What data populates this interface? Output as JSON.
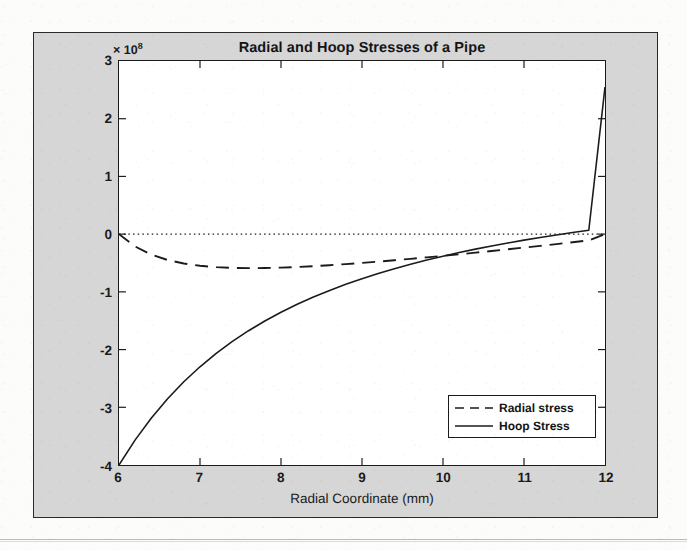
{
  "figure": {
    "window_name": "matlab-figure",
    "background_color": "#d6d6d6",
    "axes_background_color": "#ffffff",
    "border_color": "#1b1b1b"
  },
  "chart_data": {
    "type": "line",
    "title": "Radial and Hoop Stresses of a Pipe",
    "xlabel": "Radial Coordinate (mm)",
    "ylabel": "Stress (Pa)",
    "y_exponent_label": "× 10",
    "y_exponent_power": "8",
    "y_scale": 100000000,
    "xlim": [
      6,
      12
    ],
    "ylim": [
      -4,
      3
    ],
    "xticks": [
      6,
      7,
      8,
      9,
      10,
      11,
      12
    ],
    "xtick_labels": [
      "6",
      "7",
      "8",
      "9",
      "10",
      "11",
      "12"
    ],
    "yticks": [
      3,
      2,
      1,
      0,
      -1,
      -2,
      -3,
      -4
    ],
    "ytick_labels": [
      "3",
      "2",
      "1",
      "0",
      "-1",
      "-2",
      "-3",
      "-4"
    ],
    "grid": false,
    "legend_position": "lower right",
    "reference_line": {
      "name": "zero-line",
      "y": 0,
      "style": "dotted",
      "color": "#1b1b1b"
    },
    "x": [
      6.0,
      6.2,
      6.4,
      6.6,
      6.8,
      7.0,
      7.2,
      7.4,
      7.6,
      7.8,
      8.0,
      8.2,
      8.4,
      8.6,
      8.8,
      9.0,
      9.2,
      9.4,
      9.6,
      9.8,
      10.0,
      10.2,
      10.4,
      10.6,
      10.8,
      11.0,
      11.2,
      11.4,
      11.6,
      11.8,
      12.0
    ],
    "series": [
      {
        "name": "Radial stress",
        "label": "Radial stress",
        "style": "dashed",
        "color": "#1b1b1b",
        "values": [
          0.0,
          -0.215,
          -0.355,
          -0.448,
          -0.508,
          -0.548,
          -0.572,
          -0.585,
          -0.589,
          -0.587,
          -0.58,
          -0.569,
          -0.555,
          -0.538,
          -0.519,
          -0.498,
          -0.476,
          -0.452,
          -0.428,
          -0.402,
          -0.376,
          -0.349,
          -0.321,
          -0.292,
          -0.263,
          -0.233,
          -0.203,
          -0.172,
          -0.14,
          -0.109,
          0.0
        ]
      },
      {
        "name": "Hoop Stress",
        "label": "Hoop Stress",
        "style": "solid",
        "color": "#1b1b1b",
        "values": [
          -4.0,
          -3.565,
          -3.185,
          -2.852,
          -2.558,
          -2.298,
          -2.066,
          -1.859,
          -1.673,
          -1.505,
          -1.354,
          -1.216,
          -1.09,
          -0.975,
          -0.87,
          -0.772,
          -0.682,
          -0.599,
          -0.521,
          -0.449,
          -0.382,
          -0.319,
          -0.26,
          -0.205,
          -0.153,
          -0.104,
          -0.058,
          -0.014,
          0.028,
          0.067,
          2.55
        ]
      }
    ],
    "annotations": [
      {
        "name": "hoop-zero-crossing",
        "x": 8.6,
        "y": 0
      },
      {
        "name": "radial-minimum",
        "x": 7.6,
        "y": -0.589
      },
      {
        "name": "curve-intersection",
        "x": 8.2,
        "y": -0.57
      }
    ]
  }
}
